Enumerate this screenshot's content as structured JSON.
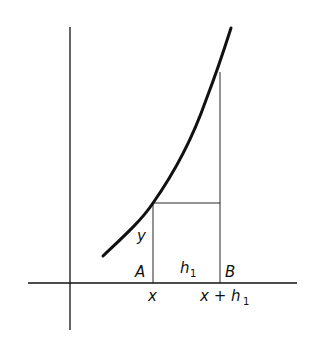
{
  "diagram": {
    "type": "function-graph-increment",
    "colors": {
      "ink": "#111111",
      "background": "#ffffff"
    },
    "axes": {
      "x_axis": {
        "x1": 28,
        "x2": 297,
        "y": 283
      },
      "y_axis": {
        "x": 70,
        "y1": 27,
        "y2": 330
      }
    },
    "curve": {
      "description": "increasing convex curve",
      "points": [
        [
          103,
          256
        ],
        [
          153,
          203
        ],
        [
          206,
          100
        ],
        [
          231,
          28
        ]
      ]
    },
    "point_A": {
      "x": 153,
      "label": "A",
      "axis_label": "x"
    },
    "point_B": {
      "x": 220,
      "label": "B",
      "axis_label_main": "x + h",
      "axis_label_sub": "1"
    },
    "height_label": "y",
    "width_label_main": "h",
    "width_label_sub": "1",
    "horizontal_line_y": 203
  }
}
